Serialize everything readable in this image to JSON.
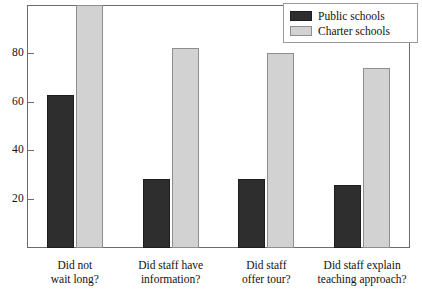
{
  "chart_data": {
    "type": "bar",
    "title": "",
    "subtitle": "",
    "xlabel": "",
    "ylabel": "",
    "categories": [
      "Did not wait long?",
      "Did staff have information?",
      "Did staff offer tour?",
      "Did staff explain teaching approach?"
    ],
    "category_lines": [
      [
        "Did not",
        "wait long?"
      ],
      [
        "Did staff have",
        "information?"
      ],
      [
        "Did staff",
        "offer tour?"
      ],
      [
        "Did staff explain",
        "teaching approach?"
      ]
    ],
    "series": [
      {
        "name": "Public schools",
        "color": "#2e2e2e",
        "border_color": "#1d1d1d",
        "values": [
          63,
          28.5,
          28.5,
          26
        ]
      },
      {
        "name": "Charter schools",
        "color": "#d2d2d2",
        "border_color": "#8e8e8e",
        "values": [
          100,
          82,
          80,
          74
        ],
        "clipped": [
          true,
          false,
          false,
          false
        ]
      }
    ],
    "ylim": [
      0,
      100
    ],
    "yticks": [
      20,
      40,
      60,
      80
    ],
    "ytick_labels": [
      "20",
      "40",
      "60",
      "80"
    ],
    "grid": false,
    "legend_position": "top-right"
  },
  "legend": {
    "entries": [
      {
        "label": "Public schools"
      },
      {
        "label": "Charter schools"
      }
    ]
  },
  "axis": {
    "ytick_labels": [
      "80",
      "60",
      "40",
      "20"
    ]
  }
}
